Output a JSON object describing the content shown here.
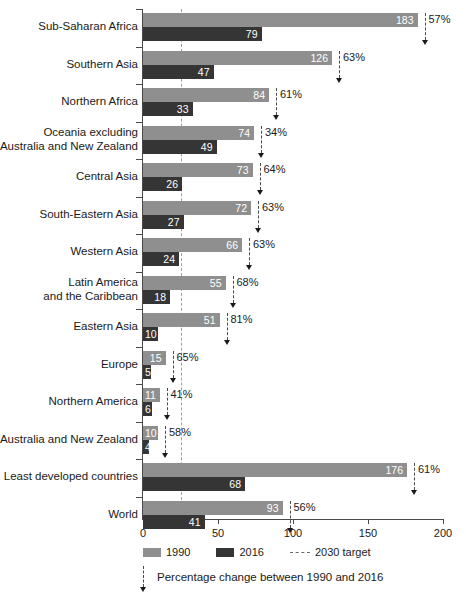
{
  "chart_data": {
    "type": "bar",
    "orientation": "horizontal",
    "title": "",
    "xlabel": "",
    "ylabel": "",
    "xlim": [
      0,
      200
    ],
    "xticks": [
      0,
      50,
      100,
      150,
      200
    ],
    "xtick_labels": [
      "0",
      "50",
      "100",
      "150",
      "200"
    ],
    "grid": false,
    "target_line_value": 25,
    "legend_position": "bottom",
    "categories": [
      "Sub-Saharan Africa",
      "Southern Asia",
      "Northern Africa",
      "Oceania excluding\nAustralia and New Zealand",
      "Central Asia",
      "South-Eastern Asia",
      "Western Asia",
      "Latin America\nand the Caribbean",
      "Eastern Asia",
      "Europe",
      "Northern America",
      "Australia and New Zealand",
      "Least developed countries",
      "World"
    ],
    "series": [
      {
        "name": "1990",
        "color": "#8f8f8f",
        "values": [
          183,
          126,
          84,
          74,
          73,
          72,
          66,
          55,
          51,
          15,
          11,
          10,
          176,
          93
        ]
      },
      {
        "name": "2016",
        "color": "#353535",
        "values": [
          79,
          47,
          33,
          49,
          26,
          27,
          24,
          18,
          10,
          5,
          6,
          4,
          68,
          41
        ]
      }
    ],
    "annotations": {
      "name": "Percentage change between 1990 and 2016",
      "values": [
        "57%",
        "63%",
        "61%",
        "34%",
        "64%",
        "63%",
        "63%",
        "68%",
        "81%",
        "65%",
        "41%",
        "58%",
        "61%",
        "56%"
      ]
    }
  },
  "legend": {
    "items": [
      {
        "label": "1990",
        "type": "swatch",
        "color": "#8f8f8f"
      },
      {
        "label": "2016",
        "type": "swatch",
        "color": "#353535"
      },
      {
        "label": "2030 target",
        "type": "dashed",
        "color": "#6a6a6a"
      }
    ]
  },
  "footnote": {
    "text": "Percentage change between 1990 and 2016"
  }
}
